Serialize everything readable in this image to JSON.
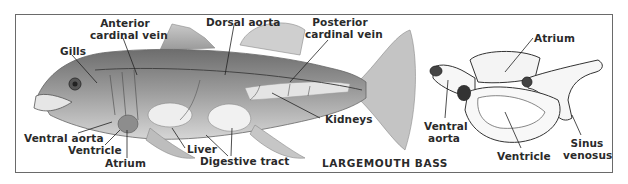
{
  "figure": {
    "fish_name": "LARGEMOUTH BASS",
    "fish_labels": {
      "gills": "Gills",
      "anterior_cardinal_vein_1": "Anterior",
      "anterior_cardinal_vein_2": "cardinal vein",
      "dorsal_aorta": "Dorsal aorta",
      "posterior_cardinal_vein_1": "Posterior",
      "posterior_cardinal_vein_2": "cardinal vein",
      "kidneys": "Kidneys",
      "ventral_aorta": "Ventral aorta",
      "ventricle": "Ventricle",
      "atrium": "Atrium",
      "liver": "Liver",
      "digestive_tract": "Digestive tract"
    },
    "heart_labels": {
      "atrium": "Atrium",
      "ventral_aorta_1": "Ventral",
      "ventral_aorta_2": "aorta",
      "ventricle": "Ventricle",
      "sinus_venosus_1": "Sinus",
      "sinus_venosus_2": "venosus"
    }
  }
}
